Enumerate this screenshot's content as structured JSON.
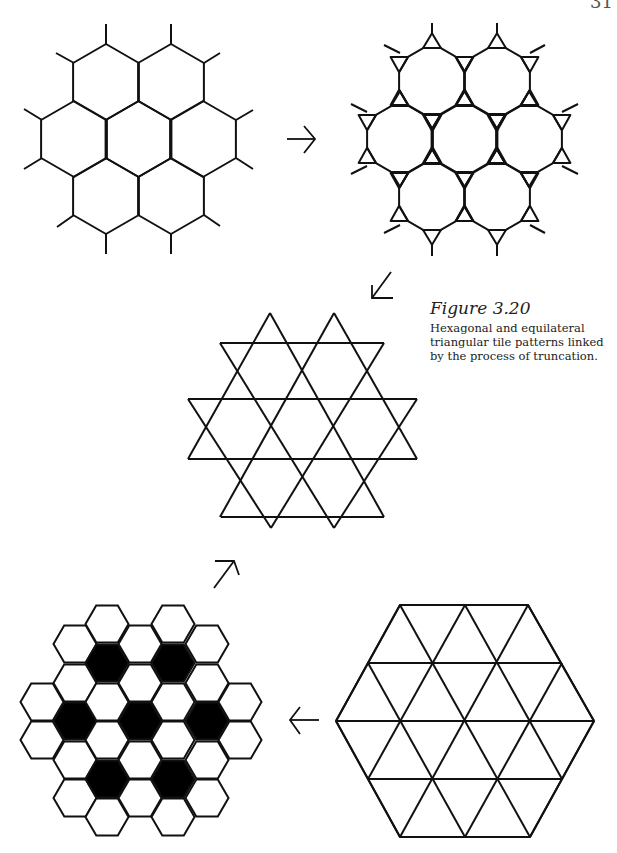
{
  "page": {
    "number": "31"
  },
  "figure": {
    "label": "Figure 3.20",
    "caption": "Hexagonal and equilateral triangular tile patterns linked by the process of truncation."
  },
  "colors": {
    "ink": "#111111",
    "paper": "#ffffff",
    "fill": "#000000"
  },
  "panels": [
    {
      "id": "hexagonal-tiling",
      "position": "top-left",
      "description": "Regular hexagonal tiling, seven hexagons"
    },
    {
      "id": "truncated-hexagonal-tiling",
      "position": "top-right",
      "description": "Hexagons truncated into dodecagons with small triangles"
    },
    {
      "id": "trihexagonal-star-pattern",
      "position": "center",
      "description": "Star of David / trihexagonal pattern of intersecting triangles"
    },
    {
      "id": "triangular-tiling",
      "position": "bottom-right",
      "description": "Equilateral triangular tiling within a large hexagon"
    },
    {
      "id": "hexagonal-tiling-shaded",
      "position": "bottom-left",
      "description": "Hexagonal tiling with seven black hexagons"
    }
  ],
  "arrows": [
    {
      "id": "arrow-right",
      "glyph": "→"
    },
    {
      "id": "arrow-down-left",
      "glyph": "↙"
    },
    {
      "id": "arrow-up-right",
      "glyph": "↗"
    },
    {
      "id": "arrow-left",
      "glyph": "←"
    }
  ]
}
